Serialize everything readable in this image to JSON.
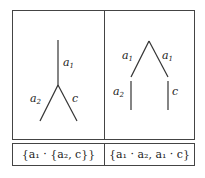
{
  "left_tree": {
    "trunk_label": "a",
    "trunk_sub": "1",
    "left_label": "a",
    "left_sub": "2",
    "right_label": "c"
  },
  "right_tree": {
    "left_top_label": "a",
    "left_top_sub": "1",
    "right_top_label": "a",
    "right_top_sub": "1",
    "left_bottom_label": "a",
    "left_bottom_sub": "2",
    "right_bottom_label": "c"
  },
  "captions": {
    "left": "{a₁ · {a₂, c}}",
    "right": "{a₁ · a₂, a₁ · c}"
  }
}
